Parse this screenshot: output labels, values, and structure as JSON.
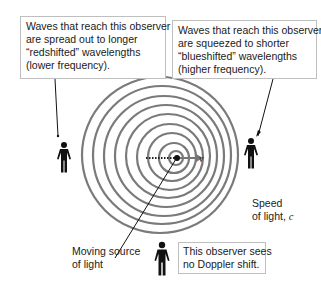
{
  "diagram": {
    "callouts": {
      "left": [
        "Waves that reach this observer",
        "are spread out to longer",
        "“redshifted” wavelengths",
        "(lower frequency)."
      ],
      "right": [
        "Waves that reach this observer",
        "are squeezed to shorter",
        "“blueshifted” wavelengths",
        "(higher frequency)."
      ],
      "bottom": [
        "This observer sees",
        "no Doppler shift."
      ]
    },
    "labels": {
      "source": [
        "Moving source",
        "of light"
      ],
      "speed": [
        "Speed",
        "of light, "
      ],
      "speed_symbol": "c",
      "velocity_symbol": "v"
    },
    "colors": {
      "rings": "#7a7a7a",
      "figure": "#111111",
      "box_border": "#bfbfbf"
    },
    "rings": 9
  }
}
